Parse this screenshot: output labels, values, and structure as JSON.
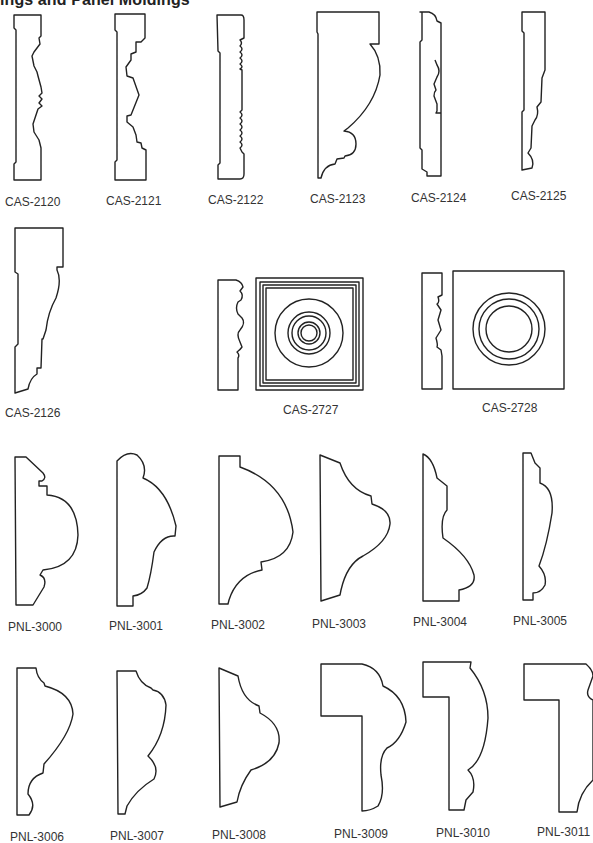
{
  "page": {
    "title": "ings and Panel Moldings"
  },
  "sections": [
    {
      "name": "casings",
      "items": [
        {
          "code": "CAS-2120"
        },
        {
          "code": "CAS-2121"
        },
        {
          "code": "CAS-2122"
        },
        {
          "code": "CAS-2123"
        },
        {
          "code": "CAS-2124"
        },
        {
          "code": "CAS-2125"
        },
        {
          "code": "CAS-2126"
        },
        {
          "code": "CAS-2727"
        },
        {
          "code": "CAS-2728"
        }
      ]
    },
    {
      "name": "panel-moldings",
      "items": [
        {
          "code": "PNL-3000"
        },
        {
          "code": "PNL-3001"
        },
        {
          "code": "PNL-3002"
        },
        {
          "code": "PNL-3003"
        },
        {
          "code": "PNL-3004"
        },
        {
          "code": "PNL-3005"
        },
        {
          "code": "PNL-3006"
        },
        {
          "code": "PNL-3007"
        },
        {
          "code": "PNL-3008"
        },
        {
          "code": "PNL-3009"
        },
        {
          "code": "PNL-3010"
        },
        {
          "code": "PNL-3011"
        }
      ]
    }
  ],
  "colors": {
    "line": "#222222",
    "background": "#ffffff",
    "label": "#333333"
  }
}
